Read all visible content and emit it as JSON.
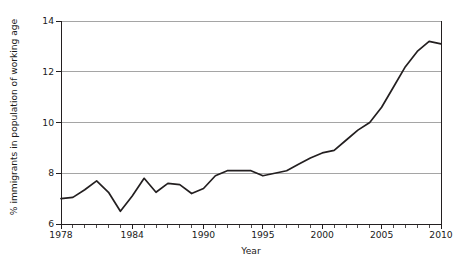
{
  "chart_data": {
    "type": "line",
    "title": "",
    "xlabel": "Year",
    "ylabel": "% immigrants in population of working age",
    "xlim": [
      1978,
      2010
    ],
    "ylim": [
      6,
      14
    ],
    "grid": "horizontal",
    "legend": "none",
    "x_tick_labels": [
      "1978",
      "1984",
      "1990",
      "1995",
      "2000",
      "2005",
      "2010"
    ],
    "x_tick_values": [
      1978,
      1984,
      1990,
      1995,
      2000,
      2005,
      2010
    ],
    "y_tick_labels": [
      "6",
      "8",
      "10",
      "12",
      "14"
    ],
    "y_tick_values": [
      6,
      8,
      10,
      12,
      14
    ],
    "x_minor_ticks_every": 1,
    "series": [
      {
        "name": "% immigrants in population of working age",
        "color": "#231f20",
        "x": [
          1978,
          1979,
          1980,
          1981,
          1982,
          1983,
          1984,
          1985,
          1986,
          1987,
          1988,
          1989,
          1990,
          1991,
          1992,
          1993,
          1994,
          1995,
          1996,
          1997,
          1998,
          1999,
          2000,
          2001,
          2002,
          2003,
          2004,
          2005,
          2006,
          2007,
          2008,
          2009,
          2010
        ],
        "values": [
          7.0,
          7.05,
          7.35,
          7.7,
          7.25,
          6.5,
          7.1,
          7.8,
          7.25,
          7.6,
          7.55,
          7.2,
          7.4,
          7.9,
          8.1,
          8.1,
          8.1,
          7.9,
          8.0,
          8.1,
          8.35,
          8.6,
          8.8,
          8.9,
          9.3,
          9.7,
          10.0,
          10.6,
          11.4,
          12.2,
          12.8,
          13.2,
          13.1
        ]
      }
    ]
  },
  "axes": {
    "y_title": "% immigrants in population of working age",
    "x_title": "Year"
  }
}
